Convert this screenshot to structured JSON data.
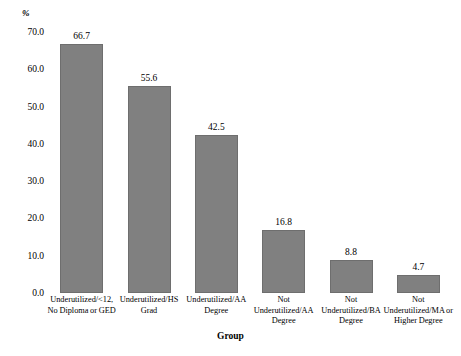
{
  "chart_data": {
    "type": "bar",
    "title": "",
    "subtitle": "",
    "xlabel": "Group",
    "ylabel": "%",
    "ylim": [
      0,
      70
    ],
    "grid": false,
    "legend": false,
    "bar_color": "#808080",
    "bar_edge_color": "#6e6e6e",
    "background_color": "#ffffff",
    "categories": [
      "Underutilized/<12,\nNo Diploma or GED",
      "Underutilized/HS\nGrad",
      "Underutilized/AA\nDegree",
      "Not\nUnderutilized/AA\nDegree",
      "Not\nUnderutilized/BA\nDegree",
      "Not\nUnderutilized/MA or\nHigher Degree"
    ],
    "category_lines": [
      [
        "Underutilized/<12,",
        "No Diploma or GED"
      ],
      [
        "Underutilized/HS",
        "Grad"
      ],
      [
        "Underutilized/AA",
        "Degree"
      ],
      [
        "Not",
        "Underutilized/AA",
        "Degree"
      ],
      [
        "Not",
        "Underutilized/BA",
        "Degree"
      ],
      [
        "Not",
        "Underutilized/MA or",
        "Higher Degree"
      ]
    ],
    "values": [
      66.7,
      55.6,
      42.5,
      16.8,
      8.8,
      4.7
    ],
    "value_labels": [
      "66.7",
      "55.6",
      "42.5",
      "16.8",
      "8.8",
      "4.7"
    ],
    "yticks": [
      0,
      10,
      20,
      30,
      40,
      50,
      60,
      70
    ],
    "ytick_labels": [
      "0.0",
      "10.0",
      "20.0",
      "30.0",
      "40.0",
      "50.0",
      "60.0",
      "70.0"
    ]
  }
}
